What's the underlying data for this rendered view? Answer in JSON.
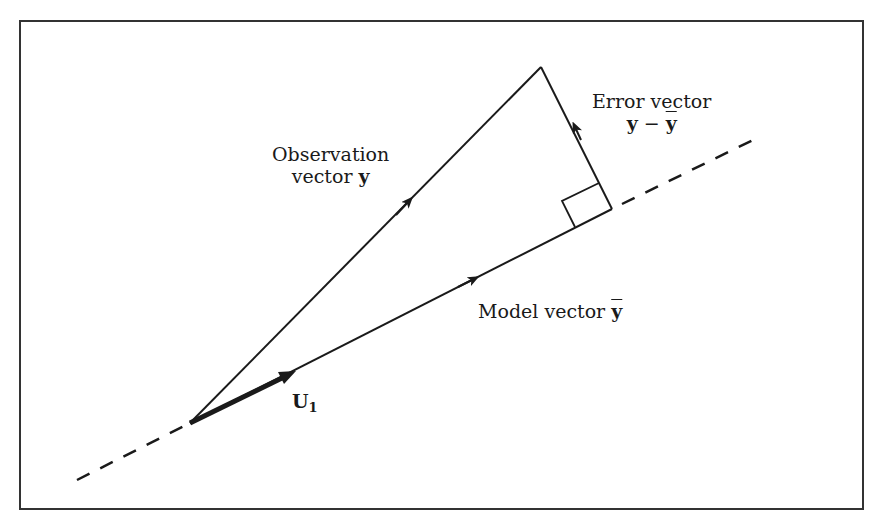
{
  "figure": {
    "labels": {
      "observation": {
        "line1": "Observation",
        "line2_prefix": "vector ",
        "symbol": "y"
      },
      "error": {
        "line1": "Error vector",
        "symbol_y": "y",
        "minus": " − ",
        "symbol_ybar": "y"
      },
      "model": {
        "prefix": "Model vector ",
        "symbol_ybar": "y"
      },
      "unit": {
        "symbol": "U",
        "subscript": "1"
      }
    },
    "colors": {
      "line": "#1a1a1a",
      "frame": "#333333",
      "background": "#ffffff"
    }
  }
}
